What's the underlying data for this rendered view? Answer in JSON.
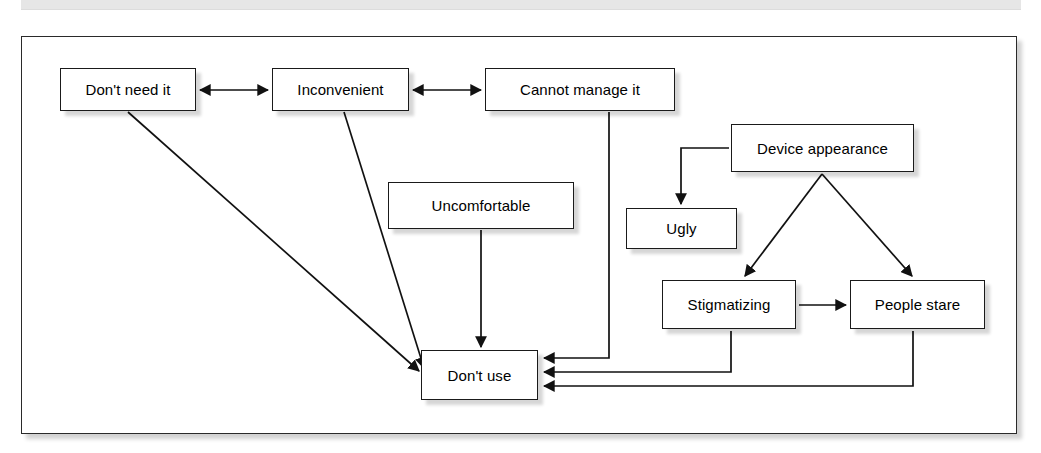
{
  "figure": {
    "type": "flow-diagram",
    "background_color": "#ffffff",
    "frame_border_color": "#2a2a2a",
    "node_border_color": "#1a1a1a",
    "top_rule_color": "#e6e6e6"
  },
  "nodes": [
    {
      "id": "dont-need-it",
      "label": "Don't need it",
      "x": 60,
      "y": 68,
      "w": 136,
      "h": 43
    },
    {
      "id": "inconvenient",
      "label": "Inconvenient",
      "x": 272,
      "y": 68,
      "w": 137,
      "h": 43
    },
    {
      "id": "cannot-manage-it",
      "label": "Cannot manage it",
      "x": 485,
      "y": 68,
      "w": 190,
      "h": 43
    },
    {
      "id": "device-appearance",
      "label": "Device appearance",
      "x": 731,
      "y": 124,
      "w": 183,
      "h": 48
    },
    {
      "id": "uncomfortable",
      "label": "Uncomfortable",
      "x": 388,
      "y": 182,
      "w": 186,
      "h": 47
    },
    {
      "id": "ugly",
      "label": "Ugly",
      "x": 626,
      "y": 208,
      "w": 111,
      "h": 41
    },
    {
      "id": "stigmatizing",
      "label": "Stigmatizing",
      "x": 662,
      "y": 280,
      "w": 134,
      "h": 49
    },
    {
      "id": "people-stare",
      "label": "People stare",
      "x": 850,
      "y": 280,
      "w": 135,
      "h": 49
    },
    {
      "id": "dont-use",
      "label": "Don't use",
      "x": 421,
      "y": 350,
      "w": 117,
      "h": 50
    }
  ],
  "edges": [
    {
      "id": "dont-need-it--inconvenient",
      "from": "dont-need-it",
      "to": "inconvenient",
      "kind": "bidirectional-horizontal"
    },
    {
      "id": "inconvenient--cannot-manage-it",
      "from": "inconvenient",
      "to": "cannot-manage-it",
      "kind": "bidirectional-horizontal"
    },
    {
      "id": "dont-need-it--dont-use",
      "from": "dont-need-it",
      "to": "dont-use",
      "kind": "diagonal-arrow"
    },
    {
      "id": "inconvenient--dont-use",
      "from": "inconvenient",
      "to": "dont-use",
      "kind": "diagonal-arrow"
    },
    {
      "id": "uncomfortable--dont-use",
      "from": "uncomfortable",
      "to": "dont-use",
      "kind": "vertical-arrow"
    },
    {
      "id": "cannot-manage-it--dont-use",
      "from": "cannot-manage-it",
      "to": "dont-use",
      "kind": "elbow-arrow"
    },
    {
      "id": "device-appearance--ugly",
      "from": "device-appearance",
      "to": "ugly",
      "kind": "elbow-arrow"
    },
    {
      "id": "device-appearance--stigmatizing",
      "from": "device-appearance",
      "to": "stigmatizing",
      "kind": "diagonal-arrow"
    },
    {
      "id": "device-appearance--people-stare",
      "from": "device-appearance",
      "to": "people-stare",
      "kind": "diagonal-arrow"
    },
    {
      "id": "stigmatizing--people-stare",
      "from": "stigmatizing",
      "to": "people-stare",
      "kind": "horizontal-arrow"
    },
    {
      "id": "stigmatizing--dont-use",
      "from": "stigmatizing",
      "to": "dont-use",
      "kind": "elbow-arrow"
    },
    {
      "id": "people-stare--dont-use",
      "from": "people-stare",
      "to": "dont-use",
      "kind": "elbow-arrow"
    }
  ]
}
